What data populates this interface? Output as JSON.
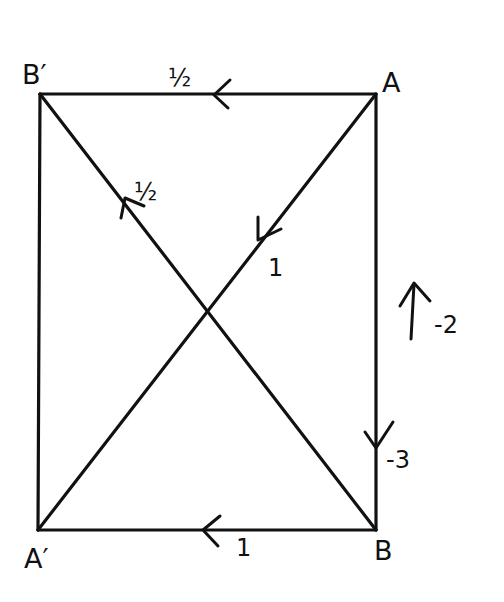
{
  "diagram": {
    "type": "flow-graph",
    "nodes": [
      {
        "id": "B_prime",
        "label": "B′",
        "x": 40,
        "y": 94
      },
      {
        "id": "A",
        "label": "A",
        "x": 376,
        "y": 94
      },
      {
        "id": "A_prime",
        "label": "A′",
        "x": 38,
        "y": 530
      },
      {
        "id": "B",
        "label": "B",
        "x": 376,
        "y": 530
      }
    ],
    "edges": [
      {
        "from": "A",
        "to": "B_prime",
        "weight": "½"
      },
      {
        "from": "B",
        "to": "B_prime",
        "weight": "½"
      },
      {
        "from": "A",
        "to": "A_prime",
        "weight": "1"
      },
      {
        "from": "B",
        "to": "A_prime",
        "weight": "1"
      },
      {
        "from": "B",
        "to": "A",
        "weight": "-2"
      },
      {
        "from": "A",
        "to": "B",
        "weight": "-3"
      },
      {
        "from": "B_prime",
        "to": "A_prime",
        "weight": ""
      }
    ]
  },
  "labels": {
    "B_prime": "B′",
    "A": "A",
    "A_prime": "A′",
    "B": "B",
    "w_top": "½",
    "w_diag_up": "½",
    "w_diag_down": "1",
    "w_bottom": "1",
    "w_right_up": "-2",
    "w_right_down": "-3"
  }
}
